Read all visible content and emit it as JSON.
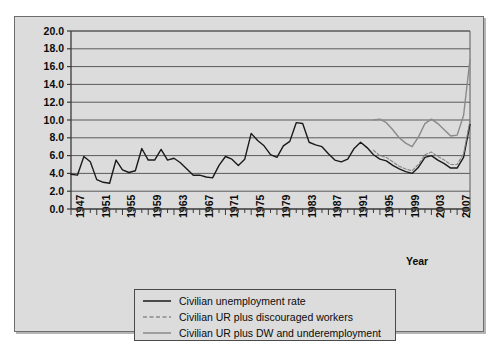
{
  "figure": {
    "background": "#ffffff",
    "panel_color": "#dcdcdc",
    "border_color": "#6d6d6d"
  },
  "chart_data": {
    "type": "line",
    "title": "",
    "xlabel": "Year",
    "ylabel": "Rate (%)",
    "xlim": [
      1947,
      2009
    ],
    "ylim": [
      0.0,
      20.0
    ],
    "grid": true,
    "legend_position": "bottom",
    "ytick_labels": [
      "0.0",
      "2.0",
      "4.0",
      "6.0",
      "8.0",
      "10.0",
      "12.0",
      "14.0",
      "16.0",
      "18.0",
      "20.0"
    ],
    "ytick_values": [
      0,
      2,
      4,
      6,
      8,
      10,
      12,
      14,
      16,
      18,
      20
    ],
    "xtick_labels": [
      "1947",
      "1951",
      "1955",
      "1959",
      "1963",
      "1967",
      "1971",
      "1975",
      "1979",
      "1983",
      "1987",
      "1991",
      "1995",
      "1999",
      "2003",
      "2007"
    ],
    "xtick_values": [
      1947,
      1951,
      1955,
      1959,
      1963,
      1967,
      1971,
      1975,
      1979,
      1983,
      1987,
      1991,
      1995,
      1999,
      2003,
      2007
    ],
    "x": [
      1947,
      1948,
      1949,
      1950,
      1951,
      1952,
      1953,
      1954,
      1955,
      1956,
      1957,
      1958,
      1959,
      1960,
      1961,
      1962,
      1963,
      1964,
      1965,
      1966,
      1967,
      1968,
      1969,
      1970,
      1971,
      1972,
      1973,
      1974,
      1975,
      1976,
      1977,
      1978,
      1979,
      1980,
      1981,
      1982,
      1983,
      1984,
      1985,
      1986,
      1987,
      1988,
      1989,
      1990,
      1991,
      1992,
      1993,
      1994,
      1995,
      1996,
      1997,
      1998,
      1999,
      2000,
      2001,
      2002,
      2003,
      2004,
      2005,
      2006,
      2007,
      2008,
      2009
    ],
    "series": [
      {
        "name": "Civilian unemployment rate",
        "color": "#1a1a1a",
        "style": "solid",
        "x": [
          1947,
          1948,
          1949,
          1950,
          1951,
          1952,
          1953,
          1954,
          1955,
          1956,
          1957,
          1958,
          1959,
          1960,
          1961,
          1962,
          1963,
          1964,
          1965,
          1966,
          1967,
          1968,
          1969,
          1970,
          1971,
          1972,
          1973,
          1974,
          1975,
          1976,
          1977,
          1978,
          1979,
          1980,
          1981,
          1982,
          1983,
          1984,
          1985,
          1986,
          1987,
          1988,
          1989,
          1990,
          1991,
          1992,
          1993,
          1994,
          1995,
          1996,
          1997,
          1998,
          1999,
          2000,
          2001,
          2002,
          2003,
          2004,
          2005,
          2006,
          2007,
          2008,
          2009
        ],
        "values": [
          3.9,
          3.8,
          5.9,
          5.3,
          3.3,
          3.0,
          2.9,
          5.5,
          4.4,
          4.1,
          4.3,
          6.8,
          5.5,
          5.5,
          6.7,
          5.5,
          5.7,
          5.2,
          4.5,
          3.8,
          3.8,
          3.6,
          3.5,
          4.9,
          5.9,
          5.6,
          4.9,
          5.6,
          8.5,
          7.7,
          7.1,
          6.1,
          5.8,
          7.1,
          7.6,
          9.7,
          9.6,
          7.5,
          7.2,
          7.0,
          6.2,
          5.5,
          5.3,
          5.6,
          6.8,
          7.5,
          6.9,
          6.1,
          5.6,
          5.4,
          4.9,
          4.5,
          4.2,
          4.0,
          4.7,
          5.8,
          6.0,
          5.5,
          5.1,
          4.6,
          4.6,
          5.8,
          9.5
        ]
      },
      {
        "name": "Civilian UR plus discouraged workers",
        "color": "#8a8a8a",
        "style": "dashed",
        "x": [
          1994,
          1995,
          1996,
          1997,
          1998,
          1999,
          2000,
          2001,
          2002,
          2003,
          2004,
          2005,
          2006,
          2007,
          2008,
          2009
        ],
        "values": [
          6.6,
          6.0,
          5.8,
          5.3,
          4.8,
          4.5,
          4.3,
          5.0,
          6.1,
          6.4,
          5.9,
          5.5,
          5.0,
          5.0,
          6.2,
          10.0
        ]
      },
      {
        "name": "Civilian UR plus DW and underemployment",
        "color": "#8a8a8a",
        "style": "solid",
        "x": [
          1994,
          1995,
          1996,
          1997,
          1998,
          1999,
          2000,
          2001,
          2002,
          2003,
          2004,
          2005,
          2006,
          2007,
          2008,
          2009
        ],
        "values": [
          10.0,
          10.1,
          9.7,
          8.9,
          8.0,
          7.4,
          7.0,
          8.1,
          9.6,
          10.1,
          9.6,
          8.9,
          8.2,
          8.3,
          10.5,
          16.8
        ]
      }
    ]
  },
  "legend": {
    "entries": [
      {
        "label": "Civilian unemployment rate",
        "icon": "solid-black-line-icon"
      },
      {
        "label": "Civilian UR plus discouraged workers",
        "icon": "dashed-gray-line-icon"
      },
      {
        "label": "Civilian UR plus DW and underemployment",
        "icon": "solid-gray-line-icon"
      }
    ]
  }
}
